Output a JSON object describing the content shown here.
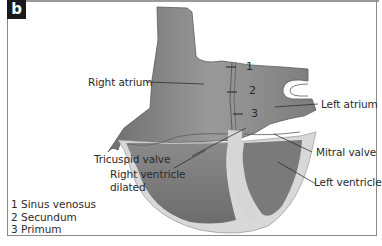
{
  "figure": {
    "panel_label": "b",
    "structures": {
      "right_atrium": "Right atrium",
      "left_atrium": "Left atrium",
      "tricuspid_valve": "Tricuspid valve",
      "right_ventricle_line1": "Right ventricle",
      "right_ventricle_line2": "dilated",
      "mitral_valve": "Mitral valve",
      "left_ventricle": "Left ventricle"
    },
    "septal_markers": [
      "1",
      "2",
      "3"
    ],
    "legend": [
      "1 Sinus venosus",
      "2 Secundum",
      "3 Primum"
    ],
    "colors": {
      "tissue_dark": "#7a7a7a",
      "tissue_mid": "#8e8e8e",
      "myocardium_wall": "#d6d6d6",
      "badge_bg": "#1a1a1a",
      "frame": "#8a8a8a"
    }
  }
}
